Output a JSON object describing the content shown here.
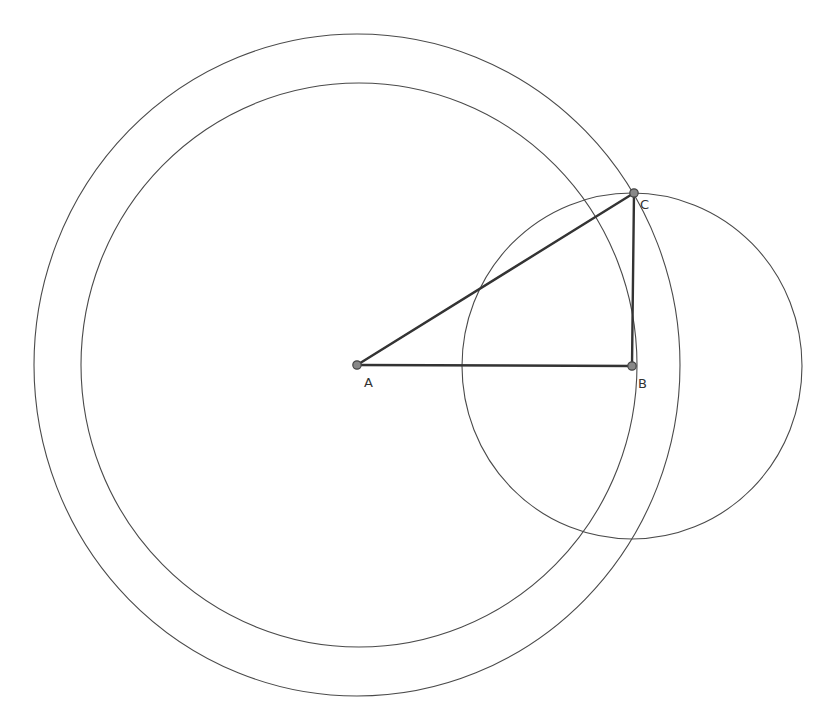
{
  "diagram": {
    "type": "geometric-construction",
    "colors": {
      "background": "#ffffff",
      "circle_stroke": "#4a4a4a",
      "segment_stroke": "#333333",
      "point_fill": "#888888",
      "label": "#333333"
    },
    "points": [
      {
        "name": "A",
        "label": "A",
        "x": 357,
        "y": 365
      },
      {
        "name": "B",
        "label": "B",
        "x": 632,
        "y": 366
      },
      {
        "name": "C",
        "label": "C",
        "x": 634,
        "y": 193
      }
    ],
    "segments": [
      {
        "from": "A",
        "to": "B"
      },
      {
        "from": "A",
        "to": "C"
      },
      {
        "from": "B",
        "to": "C"
      }
    ],
    "circles": [
      {
        "name": "outer-circle-centered-A",
        "cx": 357,
        "cy": 365,
        "rx": 323,
        "ry": 331
      },
      {
        "name": "inner-circle-centered-A",
        "cx": 359,
        "cy": 365,
        "rx": 278,
        "ry": 282
      },
      {
        "name": "circle-centered-B-through-C",
        "cx": 632,
        "cy": 366,
        "rx": 170,
        "ry": 173
      }
    ]
  }
}
